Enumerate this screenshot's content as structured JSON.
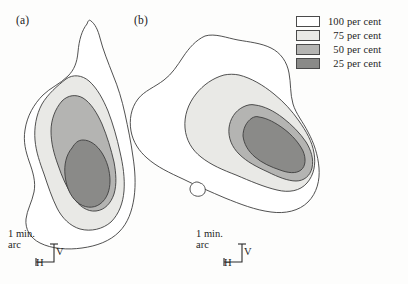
{
  "figure": {
    "background_color": "#fdfdfc",
    "width": 408,
    "height": 284
  },
  "panels": [
    {
      "id": "a",
      "label": "(a)"
    },
    {
      "id": "b",
      "label": "(b)"
    }
  ],
  "legend": {
    "title": "",
    "entries": [
      {
        "value": "100",
        "unit": "per cent",
        "level": 100,
        "color": "#ffffff"
      },
      {
        "value": "75",
        "unit": "per cent",
        "level": 75,
        "color": "#e9e9e6"
      },
      {
        "value": "50",
        "unit": "per cent",
        "level": 50,
        "color": "#b4b4b2"
      },
      {
        "value": "25",
        "unit": "per cent",
        "level": 25,
        "color": "#8a8a88"
      }
    ]
  },
  "scalebars": [
    {
      "panel": "a",
      "caption_line1": "1 min.",
      "caption_line2": "arc",
      "vertical_label": "V",
      "horizontal_label": "H"
    },
    {
      "panel": "b",
      "caption_line1": "1 min.",
      "caption_line2": "arc",
      "vertical_label": "V",
      "horizontal_label": "H"
    }
  ],
  "chart_data": {
    "type": "contour",
    "title": "",
    "xlabel": "H",
    "ylabel": "V",
    "units": "min. arc",
    "grid": false,
    "legend_position": "top-right",
    "contour_levels": [
      100,
      75,
      50,
      25
    ],
    "level_colors": [
      "#ffffff",
      "#e9e9e6",
      "#b4b4b2",
      "#8a8a88"
    ],
    "scale_reference": "1 min. arc",
    "panels": [
      {
        "id": "a",
        "label": "(a)",
        "description": "Elongated receptive-field response contours oriented from lower-left to upper-right with a narrow superior tail.",
        "contours": [
          {
            "level": 100,
            "fill": "#ffffff",
            "path": "M 87,24 C 82,30 79,40 78,52 C 77,63 74,70 68,76 C 60,84 50,88 43,95 C 34,104 27,116 25,130 C 23,142 26,152 29,161 C 33,172 36,182 34,192 C 32,202 27,210 26,219 C 25,229 30,238 40,243 C 52,249 68,250 82,248 C 97,246 110,241 119,232 C 128,223 132,211 134,198 C 136,184 135,170 133,157 C 131,142 128,128 125,114 C 122,100 118,87 113,75 C 108,62 103,50 100,38 C 98,30 95,24 91,21 C 89,19 88,21 87,24 Z"
          },
          {
            "level": 75,
            "fill": "#e9e9e6",
            "path": "M 66,79 C 57,86 48,94 42,104 C 36,115 34,128 35,140 C 36,152 40,163 44,174 C 48,186 52,198 57,208 C 62,218 70,226 80,229 C 91,232 103,229 111,222 C 119,214 123,203 124,191 C 125,178 123,165 120,152 C 117,138 113,124 108,111 C 103,99 97,88 89,81 C 82,75 73,74 66,79 Z"
          },
          {
            "level": 50,
            "fill": "#b4b4b2",
            "path": "M 62,101 C 55,109 51,120 51,131 C 51,143 54,154 58,165 C 62,177 67,188 73,197 C 79,206 87,212 96,211 C 105,210 111,203 114,194 C 117,184 116,173 114,162 C 111,149 107,136 102,124 C 97,113 91,103 83,98 C 76,94 68,95 62,101 Z"
          },
          {
            "level": 25,
            "fill": "#8a8a88",
            "path": "M 72,148 C 66,155 64,165 65,175 C 66,186 70,196 77,202 C 84,208 93,209 100,204 C 107,199 110,190 110,181 C 110,171 107,161 102,153 C 97,145 90,140 83,140 C 78,140 75,143 72,148 Z"
          }
        ]
      },
      {
        "id": "b",
        "label": "(b)",
        "description": "Broad, obliquely oriented response contours running from upper-left to lower-right, with a small isolated island region at lower left.",
        "contours": [
          {
            "level": 100,
            "fill": "#ffffff",
            "path": "M 205,36 C 196,40 189,48 183,57 C 177,66 172,74 164,80 C 155,87 144,91 138,99 C 131,108 129,120 131,131 C 133,142 139,151 147,158 C 157,167 170,173 183,179 C 197,186 211,192 225,198 C 240,204 255,210 271,212 C 285,214 299,211 308,202 C 317,193 320,180 319,168 C 318,155 314,143 308,132 C 303,122 296,114 293,104 C 290,94 291,83 289,73 C 287,62 281,53 271,48 C 261,43 249,42 238,40 C 227,38 215,33 205,36 Z"
          },
          {
            "level": 75,
            "fill": "#e9e9e6",
            "path": "M 224,75 C 213,78 203,85 196,94 C 188,104 184,116 185,128 C 186,140 192,150 201,157 C 211,165 223,170 236,175 C 250,181 264,187 277,190 C 289,193 300,191 307,183 C 314,175 316,164 314,153 C 312,141 306,131 299,121 C 292,111 284,102 274,94 C 263,85 251,78 239,75 C 234,74 229,74 224,75 Z"
          },
          {
            "level": 50,
            "fill": "#b4b4b2",
            "path": "M 243,107 C 235,111 230,119 229,128 C 228,138 232,147 239,154 C 247,162 257,167 268,172 C 278,177 288,181 296,181 C 304,181 310,176 312,168 C 314,159 311,150 306,142 C 300,133 292,125 283,118 C 274,111 264,106 255,105 C 251,104 247,105 243,107 Z"
          },
          {
            "level": 25,
            "fill": "#8a8a88",
            "path": "M 252,118 C 246,122 243,129 243,136 C 244,144 248,151 255,157 C 262,163 271,167 280,170 C 288,173 296,174 301,170 C 306,166 306,158 303,151 C 299,143 292,135 284,129 C 276,123 267,118 259,117 C 256,116 254,117 252,118 Z"
          },
          {
            "level": 100,
            "fill": "#ffffff",
            "is_island": true,
            "path": "M 196,182 C 192,183 190,186 190,189 C 190,192 192,195 196,196 C 200,197 204,195 205,192 C 206,188 204,184 200,183 C 199,182 197,182 196,182 Z"
          }
        ]
      }
    ]
  }
}
